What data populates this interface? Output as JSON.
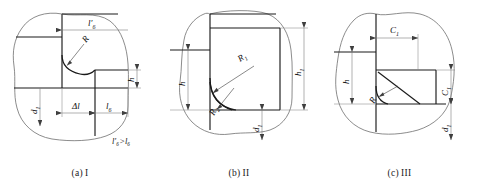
{
  "figure": {
    "colors": {
      "part_line": "#1a1a1a",
      "contour_line": "#6f6f6f",
      "dimension_line": "#7d7d7d",
      "background": "#ffffff"
    }
  },
  "panels": [
    {
      "id": "a",
      "caption_index": "(a)",
      "caption_roman": "I",
      "labels": {
        "top_length": "l",
        "top_length_sub": "6",
        "top_length_prime": "′",
        "radius": "R",
        "height": "h",
        "depth": "d",
        "depth_sub": "1",
        "delta": "Δl",
        "length": "l",
        "length_sub": "6",
        "inequality": "l′₆>l₆"
      }
    },
    {
      "id": "b",
      "caption_index": "(b)",
      "caption_roman": "II",
      "labels": {
        "height_left": "h",
        "height_right": "h",
        "height_right_sub": "1",
        "radius_1": "R",
        "radius_1_sub": "1",
        "radius_2": "R",
        "radius_2_sub": "2",
        "depth": "d",
        "depth_sub": "1"
      }
    },
    {
      "id": "c",
      "caption_index": "(c)",
      "caption_roman": "III",
      "labels": {
        "chamfer_top": "C",
        "chamfer_top_sub": "1",
        "chamfer_right": "C",
        "chamfer_right_sub": "1",
        "height_left": "h",
        "radius": "R",
        "depth": "d",
        "depth_sub": "1"
      }
    }
  ]
}
